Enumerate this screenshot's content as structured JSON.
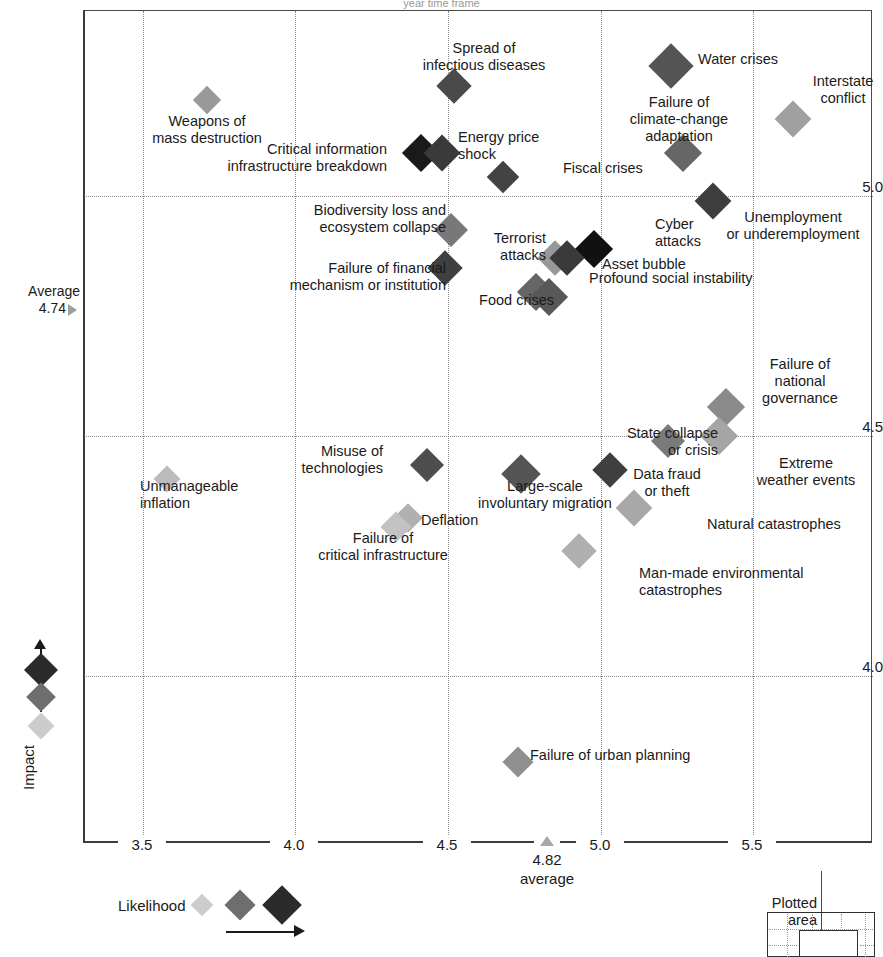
{
  "title": "year time frame",
  "axes": {
    "x_label_bottom": "",
    "y_label": "Impact",
    "x_ticks": [
      "3.5",
      "4.0",
      "4.5",
      "5.0",
      "5.5"
    ],
    "y_ticks": [
      "5.0",
      "4.5",
      "4.0"
    ],
    "x_average_value": "4.82",
    "x_average_caption": "average",
    "y_average_caption": "Average",
    "y_average_value": "4.74"
  },
  "legend": {
    "likelihood_label": "Likelihood",
    "plotted_area_label": "Plotted\narea"
  },
  "chart_data": {
    "type": "scatter",
    "title": "year time frame",
    "xlabel": "Likelihood",
    "ylabel": "Impact",
    "xlim": [
      3.25,
      5.75
    ],
    "ylim": [
      3.71,
      5.33
    ],
    "grid": true,
    "x_average": 4.82,
    "y_average": 4.74,
    "size_encodes": "Likelihood",
    "color_encodes": "Likelihood",
    "points": [
      {
        "label": "Weapons of\nmass destruction",
        "x": 3.71,
        "y": 5.2,
        "size": 20,
        "color": "#999999",
        "label_pos": "below",
        "lx": 207,
        "ly": 113,
        "align": "c"
      },
      {
        "label": "Spread of\ninfectious diseases",
        "x": 4.52,
        "y": 5.23,
        "size": 25,
        "color": "#4a4a4a",
        "label_pos": "above",
        "lx": 484,
        "ly": 40,
        "align": "c"
      },
      {
        "label": "Water crises",
        "x": 5.23,
        "y": 5.27,
        "size": 32,
        "color": "#555555",
        "label_pos": "right",
        "lx": 698,
        "ly": 51,
        "align": "l"
      },
      {
        "label": "Interstate\nconflict",
        "x": 5.63,
        "y": 5.16,
        "size": 26,
        "color": "#a0a0a0",
        "label_pos": "above",
        "lx": 843,
        "ly": 73,
        "align": "c"
      },
      {
        "label": "Critical information\ninfrastructure breakdown",
        "x": 4.41,
        "y": 5.09,
        "size": 27,
        "color": "#1a1a1a",
        "label_pos": "left",
        "lx": 387,
        "ly": 141,
        "align": "r"
      },
      {
        "label": "Energy price\nshock",
        "x": 4.48,
        "y": 5.09,
        "size": 26,
        "color": "#3a3a3a",
        "label_pos": "right",
        "lx": 458,
        "ly": 129,
        "align": "l"
      },
      {
        "label": "Failure of\nclimate-change\nadaptation",
        "x": 5.27,
        "y": 5.09,
        "size": 27,
        "color": "#666666",
        "label_pos": "left",
        "lx": 679,
        "ly": 94,
        "align": "c"
      },
      {
        "label": "Fiscal crises",
        "x": 4.68,
        "y": 5.04,
        "size": 23,
        "color": "#434343",
        "label_pos": "right",
        "lx": 563,
        "ly": 160,
        "align": "l"
      },
      {
        "label": "Unemployment\nor underemployment",
        "x": 5.37,
        "y": 4.99,
        "size": 26,
        "color": "#3d3d3d",
        "label_pos": "below",
        "lx": 793,
        "ly": 209,
        "align": "c"
      },
      {
        "label": "Biodiversity loss and\necosystem collapse",
        "x": 4.51,
        "y": 4.93,
        "size": 24,
        "color": "#787878",
        "label_pos": "left",
        "lx": 446,
        "ly": 202,
        "align": "r"
      },
      {
        "label": "Cyber\nattacks",
        "x": 4.98,
        "y": 4.89,
        "size": 27,
        "color": "#111111",
        "label_pos": "right",
        "lx": 655,
        "ly": 216,
        "align": "l"
      },
      {
        "label": "Terrorist\nattacks",
        "x": 4.85,
        "y": 4.87,
        "size": 25,
        "color": "#989898",
        "label_pos": "left",
        "lx": 546,
        "ly": 230,
        "align": "r"
      },
      {
        "label": "Asset bubble",
        "x": 4.89,
        "y": 4.87,
        "size": 25,
        "color": "#3a3a3a",
        "label_pos": "below",
        "lx": 602,
        "ly": 256,
        "align": "l"
      },
      {
        "label": "Failure of financial\nmechanism or institution",
        "x": 4.49,
        "y": 4.85,
        "size": 25,
        "color": "#404040",
        "label_pos": "left",
        "lx": 446,
        "ly": 260,
        "align": "r"
      },
      {
        "label": "Food crises",
        "x": 4.79,
        "y": 4.8,
        "size": 27,
        "color": "#666666",
        "label_pos": "left",
        "lx": 554,
        "ly": 292,
        "align": "r"
      },
      {
        "label": "Profound social instability",
        "x": 4.83,
        "y": 4.79,
        "size": 27,
        "color": "#585858",
        "label_pos": "right",
        "lx": 589,
        "ly": 270,
        "align": "l"
      },
      {
        "label": "Failure of\nnational\ngovernance",
        "x": 5.41,
        "y": 4.56,
        "size": 27,
        "color": "#8a8a8a",
        "label_pos": "right",
        "lx": 800,
        "ly": 356,
        "align": "c"
      },
      {
        "label": "State collapse\nor crisis",
        "x": 5.22,
        "y": 4.49,
        "size": 24,
        "color": "#7a7a7a",
        "label_pos": "left",
        "lx": 718,
        "ly": 425,
        "align": "r"
      },
      {
        "label": "Extreme\nweather events",
        "x": 5.39,
        "y": 4.5,
        "size": 27,
        "color": "#a5a5a5",
        "label_pos": "below",
        "lx": 806,
        "ly": 455,
        "align": "c"
      },
      {
        "label": "Misuse of\ntechnologies",
        "x": 4.43,
        "y": 4.44,
        "size": 24,
        "color": "#4d4d4d",
        "label_pos": "left",
        "lx": 383,
        "ly": 443,
        "align": "r"
      },
      {
        "label": "Unmanageable\ninflation",
        "x": 3.58,
        "y": 4.41,
        "size": 19,
        "color": "#bbbbbb",
        "label_pos": "right",
        "lx": 140,
        "ly": 478,
        "align": "l"
      },
      {
        "label": "Large-scale\ninvoluntary migration",
        "x": 4.74,
        "y": 4.42,
        "size": 28,
        "color": "#555555",
        "label_pos": "below",
        "lx": 545,
        "ly": 478,
        "align": "c"
      },
      {
        "label": "Data fraud\nor theft",
        "x": 5.03,
        "y": 4.43,
        "size": 25,
        "color": "#3f3f3f",
        "label_pos": "below",
        "lx": 667,
        "ly": 466,
        "align": "c"
      },
      {
        "label": "Deflation",
        "x": 4.37,
        "y": 4.33,
        "size": 21,
        "color": "#b0b0b0",
        "label_pos": "right",
        "lx": 421,
        "ly": 512,
        "align": "l"
      },
      {
        "label": "Failure of\ncritical infrastructure",
        "x": 4.33,
        "y": 4.31,
        "size": 22,
        "color": "#c2c2c2",
        "label_pos": "below",
        "lx": 383,
        "ly": 530,
        "align": "c"
      },
      {
        "label": "Natural catastrophes",
        "x": 5.11,
        "y": 4.35,
        "size": 26,
        "color": "#a8a8a8",
        "label_pos": "below",
        "lx": 707,
        "ly": 516,
        "align": "l"
      },
      {
        "label": "Man-made environmental\ncatastrophes",
        "x": 4.93,
        "y": 4.26,
        "size": 25,
        "color": "#afafaf",
        "label_pos": "below",
        "lx": 639,
        "ly": 565,
        "align": "l"
      },
      {
        "label": "Failure of urban planning",
        "x": 4.73,
        "y": 3.82,
        "size": 22,
        "color": "#8f8f8f",
        "label_pos": "right",
        "lx": 530,
        "ly": 747,
        "align": "l"
      }
    ],
    "size_legend": [
      {
        "color": "#cccccc",
        "size": 16
      },
      {
        "color": "#6e6e6e",
        "size": 22
      },
      {
        "color": "#2b2b2b",
        "size": 28
      }
    ],
    "impact_legend": [
      {
        "color": "#2b2b2b",
        "size": 24
      },
      {
        "color": "#6e6e6e",
        "size": 21
      },
      {
        "color": "#cccccc",
        "size": 19
      }
    ]
  }
}
